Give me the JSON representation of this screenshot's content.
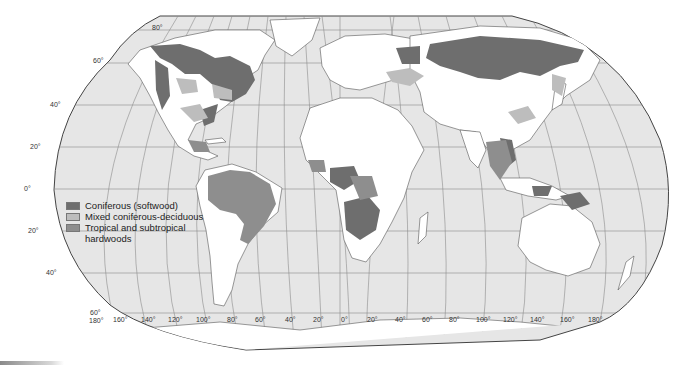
{
  "map": {
    "projection": "Robinson",
    "colors": {
      "ocean": "#e6e6e6",
      "land": "#ffffff",
      "coniferous": "#6e6e6e",
      "mixed": "#bdbdbd",
      "tropical": "#8e8e8e",
      "outline": "#444444",
      "graticule": "#8c8c8c"
    },
    "latitude_labels": [
      "80°",
      "60°",
      "40°",
      "20°",
      "0°",
      "20°",
      "40°",
      "60°"
    ],
    "longitude_labels": [
      "180°",
      "160°",
      "140°",
      "120°",
      "100°",
      "80°",
      "60°",
      "40°",
      "20°",
      "0°",
      "20°",
      "40°",
      "60°",
      "80°",
      "100°",
      "120°",
      "140°",
      "160°",
      "180°"
    ]
  },
  "legend": {
    "items": [
      {
        "label": "Coniferous (softwood)",
        "color": "#6e6e6e"
      },
      {
        "label": "Mixed coniferous-deciduous",
        "color": "#bdbdbd"
      },
      {
        "label": "Tropical and subtropical",
        "label_cont": "hardwoods",
        "color": "#8e8e8e"
      }
    ]
  }
}
